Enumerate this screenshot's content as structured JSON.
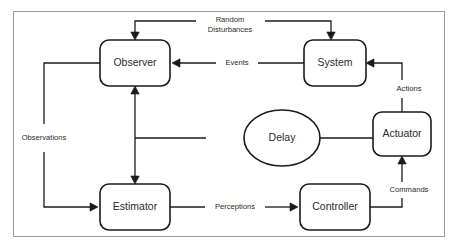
{
  "diagram": {
    "frame": {
      "border_color": "#9b9b9b",
      "background": "#ffffff"
    },
    "line_color": "#1b1b1b",
    "text_color": "#2a2a2a",
    "nodes": [
      {
        "id": "observer",
        "label": "Observer",
        "shape": "rounded-rect",
        "x": 100,
        "y": 40,
        "w": 70,
        "h": 46
      },
      {
        "id": "system",
        "label": "System",
        "shape": "rounded-rect",
        "x": 304,
        "y": 40,
        "w": 62,
        "h": 46
      },
      {
        "id": "delay",
        "label": "Delay",
        "shape": "ellipse",
        "x": 244,
        "y": 110,
        "w": 76,
        "h": 56
      },
      {
        "id": "actuator",
        "label": "Actuator",
        "shape": "rounded-rect",
        "x": 373,
        "y": 112,
        "w": 58,
        "h": 44
      },
      {
        "id": "estimator",
        "label": "Estimator",
        "shape": "rounded-rect",
        "x": 100,
        "y": 184,
        "w": 70,
        "h": 46
      },
      {
        "id": "controller",
        "label": "Controller",
        "shape": "rounded-rect",
        "x": 300,
        "y": 184,
        "w": 70,
        "h": 46
      }
    ],
    "edges": [
      {
        "id": "random-disturbances",
        "label": "Random",
        "label2": "Disturbances",
        "from": "",
        "to": "observer-and-system",
        "label_x": 230,
        "label_y": 20,
        "label2_y": 30,
        "paths": [
          "M 196 21 L 135 21 L 135 38",
          "M 265 21 L 331 21 L 331 38"
        ],
        "arrows": [
          {
            "x": 135,
            "y": 40,
            "dir": "down"
          },
          {
            "x": 331,
            "y": 40,
            "dir": "down"
          }
        ]
      },
      {
        "id": "events",
        "label": "Events",
        "from": "system",
        "to": "observer",
        "label_x": 237,
        "label_y": 63,
        "paths": [
          "M 304 63 L 258 63",
          "M 216 63 L 174 63"
        ],
        "arrows": [
          {
            "x": 172,
            "y": 63,
            "dir": "left"
          }
        ]
      },
      {
        "id": "actions",
        "label": "Actions",
        "from": "actuator",
        "to": "system",
        "label_x": 409,
        "label_y": 89,
        "paths": [
          "M 402 112 L 402 98",
          "M 402 80 L 402 63 L 368 63"
        ],
        "arrows": [
          {
            "x": 366,
            "y": 63,
            "dir": "left"
          }
        ]
      },
      {
        "id": "actuator-to-delay",
        "label": "",
        "from": "actuator",
        "to": "delay",
        "paths": [
          "M 373 138 L 286 138"
        ],
        "arrows": [
          {
            "x": 284,
            "y": 138,
            "dir": "left"
          }
        ]
      },
      {
        "id": "delay-to-bus",
        "label": "",
        "from": "delay",
        "to": "vertical-bus",
        "paths": [
          "M 206 138 L 135 138"
        ],
        "arrows": []
      },
      {
        "id": "vertical-bus",
        "label": "",
        "from": "estimator",
        "to": "observer",
        "paths": [
          "M 135 88 L 135 182"
        ],
        "arrows": [
          {
            "x": 135,
            "y": 86,
            "dir": "up"
          },
          {
            "x": 135,
            "y": 184,
            "dir": "down"
          }
        ]
      },
      {
        "id": "observations",
        "label": "Observations",
        "from": "observer",
        "to": "estimator",
        "label_x": 44,
        "label_y": 138,
        "paths": [
          "M 100 63 L 44 63 L 44 124",
          "M 44 152 L 44 207 L 96 207"
        ],
        "arrows": [
          {
            "x": 98,
            "y": 207,
            "dir": "right"
          }
        ]
      },
      {
        "id": "perceptions",
        "label": "Perceptions",
        "from": "estimator",
        "to": "controller",
        "label_x": 235,
        "label_y": 207,
        "paths": [
          "M 170 207 L 205 207",
          "M 265 207 L 296 207"
        ],
        "arrows": [
          {
            "x": 298,
            "y": 207,
            "dir": "right"
          }
        ]
      },
      {
        "id": "commands",
        "label": "Commands",
        "from": "controller",
        "to": "actuator",
        "label_x": 409,
        "label_y": 190,
        "paths": [
          "M 370 207 L 402 207 L 402 198",
          "M 402 182 L 402 158"
        ],
        "arrows": [
          {
            "x": 402,
            "y": 156,
            "dir": "up"
          }
        ]
      }
    ]
  }
}
